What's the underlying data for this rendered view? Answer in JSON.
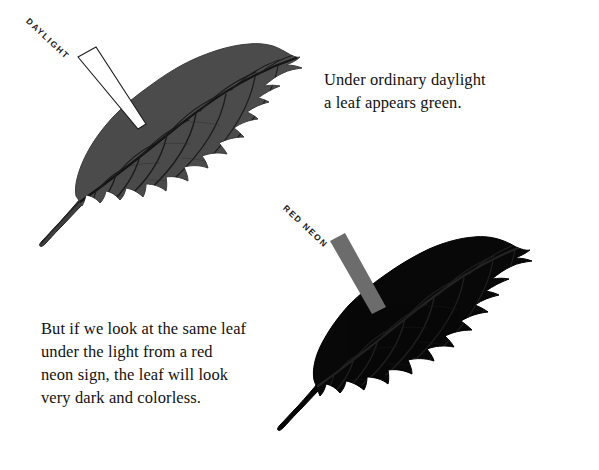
{
  "page": {
    "width": 599,
    "height": 470,
    "background_color": "#ffffff"
  },
  "captions": {
    "daylight": {
      "lines": [
        "Under ordinary daylight",
        "a leaf appears green."
      ],
      "full_text": "Under ordinary daylight a leaf appears green."
    },
    "red_neon": {
      "lines": [
        "But if we look at the same leaf",
        "under the light from a red",
        "neon sign, the leaf will look",
        "very dark and colorless."
      ],
      "full_text": "But if we look at the same leaf under the light from a red neon sign, the leaf will look very dark and colorless."
    }
  },
  "beams": {
    "daylight": {
      "label": "DAYLIGHT",
      "fill_color": "#ffffff",
      "stroke_color": "#1a1a1a",
      "rotation_degrees": 43
    },
    "red_neon": {
      "label": "RED NEON",
      "fill_color": "#6c6c6c",
      "stroke_color": "#6c6c6c",
      "rotation_degrees": 43
    }
  },
  "leaves": {
    "daylight_leaf": {
      "name": "gray leaf under daylight",
      "fill_color": "#4b4b4b",
      "vein_color": "#1c1c1c",
      "edge_color": "#3a3a3a"
    },
    "red_neon_leaf": {
      "name": "black leaf under red neon",
      "fill_color": "#080808",
      "vein_color": "#1e1e1e",
      "edge_color": "#000000"
    }
  }
}
